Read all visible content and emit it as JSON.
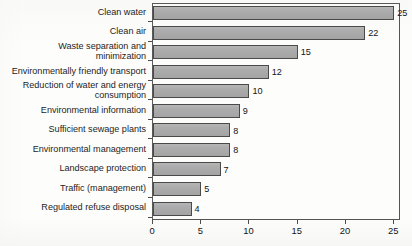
{
  "chart_data": {
    "type": "bar",
    "orientation": "horizontal",
    "title": "",
    "subtitle": "",
    "xlabel": "",
    "ylabel": "",
    "categories": [
      "Clean water",
      "Clean air",
      "Waste separation and\nminimization",
      "Environmentally friendly transport",
      "Reduction of water and energy\nconsumption",
      "Environmental information",
      "Sufficient sewage plants",
      "Environmental management",
      "Landscape protection",
      "Traffic (management)",
      "Regulated refuse disposal"
    ],
    "values": [
      25,
      22,
      15,
      12,
      10,
      9,
      8,
      8,
      7,
      5,
      4
    ],
    "data_labels": [
      "25",
      "22",
      "15",
      "12",
      "10",
      "9",
      "8",
      "8",
      "7",
      "5",
      "4"
    ],
    "xlim": [
      0,
      25.7
    ],
    "xticks": [
      0,
      5,
      10,
      15,
      20,
      25
    ],
    "xtick_labels": [
      "0",
      "5",
      "10",
      "15",
      "20",
      "25"
    ],
    "grid": false,
    "legend": false,
    "bar_color": "#a9a9a9",
    "bar_border_color": "#4a4a4a",
    "axis_color": "#4d4d4d",
    "text_color": "#141414",
    "background": "#ffffff"
  }
}
